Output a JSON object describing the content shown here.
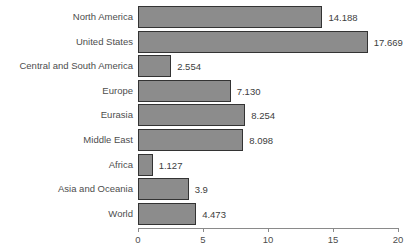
{
  "chart_data": {
    "type": "bar",
    "orientation": "horizontal",
    "title": "",
    "subtitle": "",
    "xlabel": "",
    "ylabel": "",
    "categories": [
      "North America",
      "United States",
      "Central and South America",
      "Europe",
      "Eurasia",
      "Middle East",
      "Africa",
      "Asia and Oceania",
      "World"
    ],
    "values": [
      14.188,
      17.669,
      2.554,
      7.13,
      8.254,
      8.098,
      1.127,
      3.9,
      4.473
    ],
    "value_labels": [
      "14.188",
      "17.669",
      "2.554",
      "7.130",
      "8.254",
      "8.098",
      "1.127",
      "3.9",
      "4.473"
    ],
    "xlim": [
      0,
      20
    ],
    "xticks": [
      0,
      5,
      10,
      15,
      20
    ],
    "xtick_labels": [
      "0",
      "5",
      "10",
      "15",
      "20"
    ],
    "grid": false,
    "legend": false,
    "bar_color": "#8c8c8c",
    "bar_border_color": "#333333",
    "axis_color": "#8a8a8a",
    "text_color": "#4d4d4d",
    "background": "#ffffff"
  }
}
